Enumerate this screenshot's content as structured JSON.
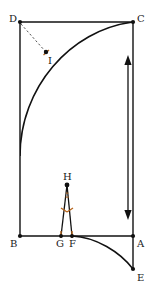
{
  "figure": {
    "type": "geometry-diagram",
    "background_color": "#ffffff",
    "stroke_color": "#111111",
    "mark_color": "#b5651d",
    "dash_color": "#555555",
    "width": 166,
    "height": 302,
    "points": [
      {
        "id": "A",
        "label": "A",
        "x": 133,
        "y": 236,
        "label_x": 137,
        "label_y": 239,
        "dot": true
      },
      {
        "id": "B",
        "label": "B",
        "x": 20,
        "y": 236,
        "label_x": 10,
        "label_y": 239,
        "dot": true
      },
      {
        "id": "C",
        "label": "C",
        "x": 133,
        "y": 22,
        "label_x": 137,
        "label_y": 14,
        "dot": true
      },
      {
        "id": "D",
        "label": "D",
        "x": 20,
        "y": 22,
        "label_x": 9,
        "label_y": 14,
        "dot": true
      },
      {
        "id": "E",
        "label": "E",
        "x": 133,
        "y": 269,
        "label_x": 137,
        "label_y": 273,
        "dot": true
      },
      {
        "id": "F",
        "label": "F",
        "x": 72,
        "y": 236,
        "label_x": 69,
        "label_y": 239,
        "dot": true
      },
      {
        "id": "G",
        "label": "G",
        "x": 61,
        "y": 236,
        "label_x": 56,
        "label_y": 239,
        "dot": true
      },
      {
        "id": "H",
        "label": "H",
        "x": 67,
        "y": 185,
        "label_x": 63,
        "label_y": 172,
        "dot": true
      },
      {
        "id": "I",
        "label": "I",
        "x": 46,
        "y": 52,
        "label_x": 48,
        "label_y": 56,
        "dot": true
      }
    ],
    "segments": [
      {
        "name": "side-BA",
        "from": "B",
        "to": "A",
        "style": "solid"
      },
      {
        "name": "side-AC",
        "from": "A",
        "to": "C",
        "style": "solid"
      },
      {
        "name": "side-CD",
        "from": "C",
        "to": "D",
        "style": "solid"
      },
      {
        "name": "side-DB",
        "from": "D",
        "to": "B",
        "style": "solid"
      },
      {
        "name": "segment-AE",
        "from": "A",
        "to": "E",
        "style": "solid"
      },
      {
        "name": "radius-DI",
        "from": "D",
        "to": "I",
        "style": "dashed"
      },
      {
        "name": "triangle-leg-HG",
        "from": "H",
        "to": "G",
        "style": "solid"
      },
      {
        "name": "triangle-leg-HF",
        "from": "H",
        "to": "F",
        "style": "solid"
      }
    ],
    "arcs": [
      {
        "name": "arc-major-DC",
        "center_x": 20,
        "center_y": 236,
        "radius": 214,
        "description": "arc from left side up to corner C"
      },
      {
        "name": "arc-minor-FE",
        "center_x": 72,
        "center_y": 58,
        "radius": 178,
        "description": "arc from F down to E"
      }
    ],
    "tick_marks": [
      {
        "name": "tick-on-I",
        "x": 46,
        "y": 52,
        "angle": -45
      },
      {
        "name": "tick-leg-HG",
        "x": 64,
        "y": 210,
        "angle": 76
      },
      {
        "name": "tick-leg-HF",
        "x": 70,
        "y": 210,
        "angle": -78
      },
      {
        "name": "tick-base-G",
        "x": 61,
        "y": 233,
        "angle": 0
      },
      {
        "name": "tick-base-F",
        "x": 72,
        "y": 233,
        "angle": 0
      }
    ],
    "angle_marks": [
      {
        "name": "angle-at-H",
        "vertex": "H",
        "x": 67,
        "y": 197,
        "radius": 6
      }
    ],
    "arrow": {
      "name": "height-double-arrow",
      "x": 128,
      "y_top": 57,
      "y_bottom": 218,
      "heads": "both"
    }
  }
}
